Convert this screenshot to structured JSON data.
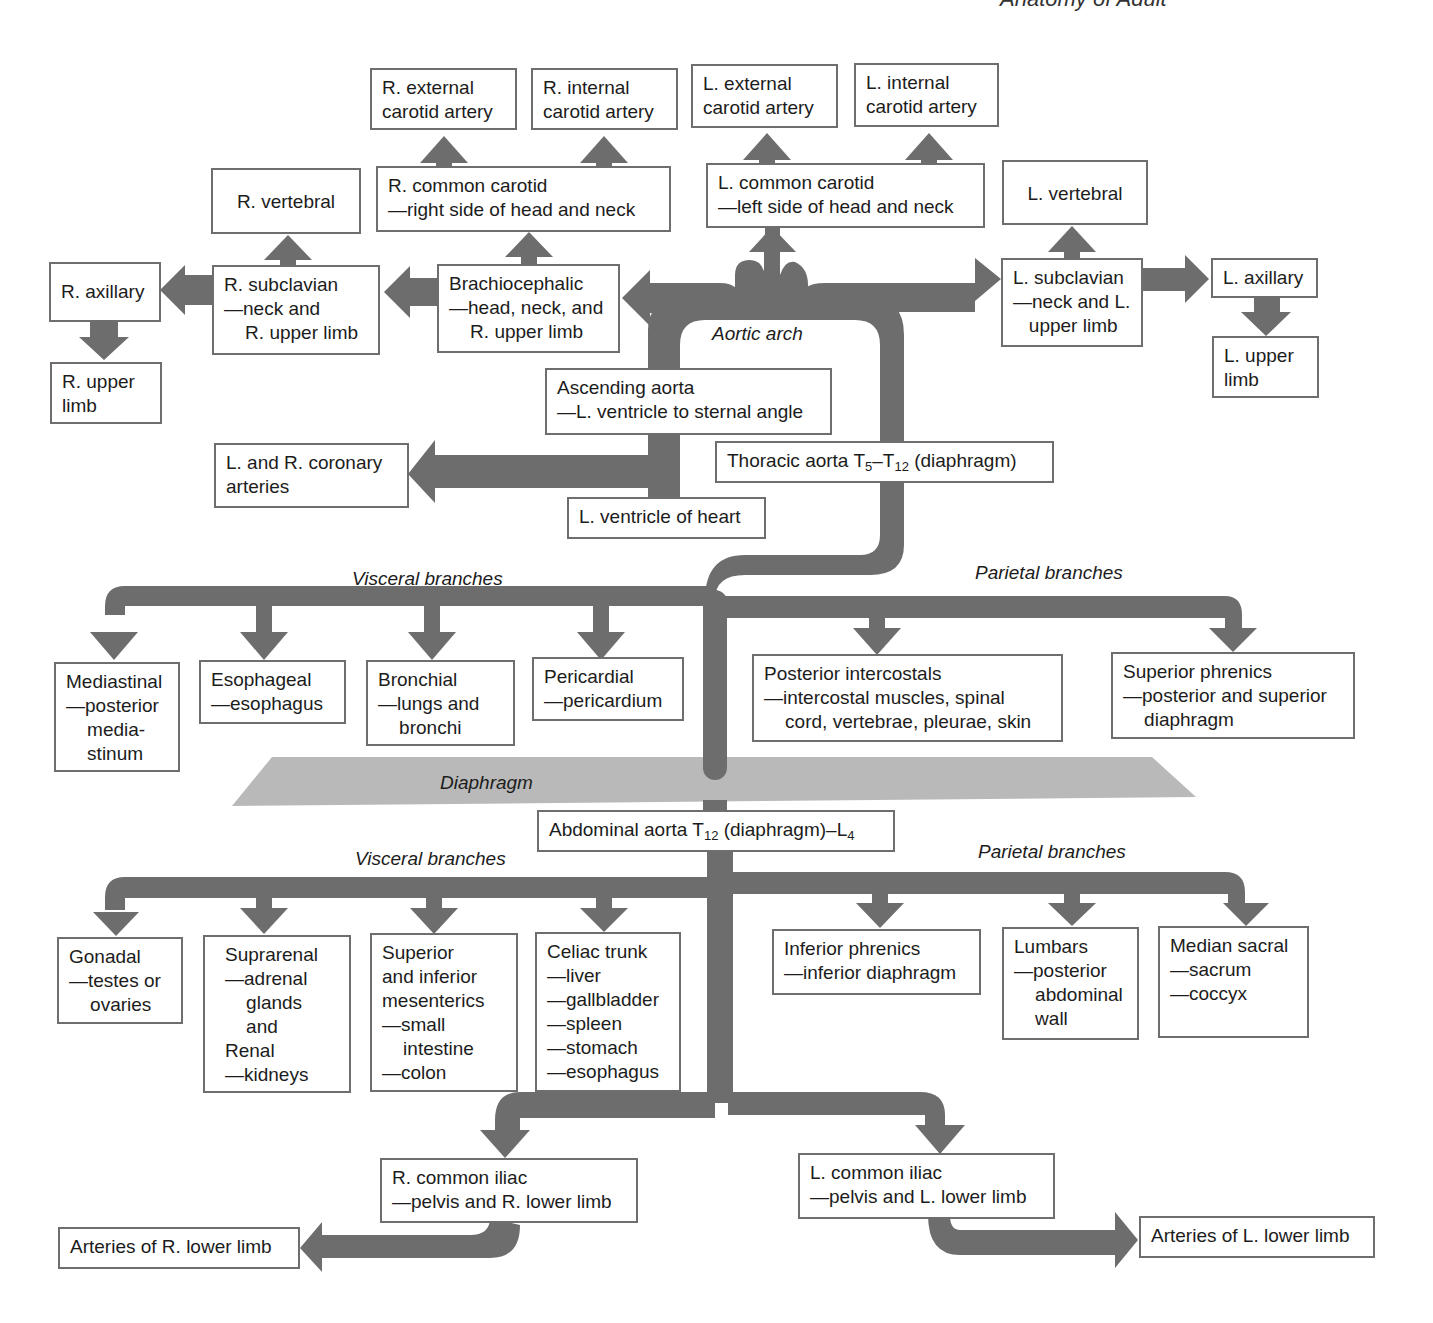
{
  "running_header": "Anatomy of Adult",
  "colors": {
    "pipe": "#6d6d6d",
    "diaphragm": "#b9b9b9",
    "box_border": "#6e6e6e"
  },
  "labels": {
    "aortic_arch": "Aortic arch",
    "diaphragm": "Diaphragm",
    "thoracic_visceral": "Visceral branches",
    "thoracic_parietal": "Parietal branches",
    "abdominal_visceral": "Visceral branches",
    "abdominal_parietal": "Parietal branches"
  },
  "head_neck": {
    "r_external_carotid": "R. external\ncarotid artery",
    "r_internal_carotid": "R. internal\ncarotid artery",
    "l_external_carotid": "L. external\ncarotid artery",
    "l_internal_carotid": "L. internal\ncarotid artery",
    "r_common_carotid": "R. common carotid\n—right side of head and neck",
    "l_common_carotid": "L. common carotid\n—left side of head and neck",
    "r_vertebral": "R. vertebral",
    "l_vertebral": "L. vertebral"
  },
  "upper_limb": {
    "r_axillary": "R. axillary",
    "r_upper_limb": "R. upper\nlimb",
    "r_subclavian": "R. subclavian\n—neck and\n    R. upper limb",
    "brachiocephalic": "Brachiocephalic\n—head, neck, and\n    R. upper limb",
    "l_subclavian": "L. subclavian\n—neck and L.\n   upper limb",
    "l_axillary": "L. axillary",
    "l_upper_limb": "L. upper\nlimb"
  },
  "heart": {
    "ascending_aorta": "Ascending aorta\n—L. ventricle to sternal angle",
    "coronary": "L. and R. coronary\narteries",
    "l_ventricle": "L. ventricle of heart",
    "thoracic_aorta_prefix": "Thoracic aorta T",
    "thoracic_aorta_sub1": "5",
    "thoracic_aorta_mid": "–T",
    "thoracic_aorta_sub2": "12",
    "thoracic_aorta_suffix": " (diaphragm)"
  },
  "thoracic_visceral": [
    "Mediastinal\n—posterior\n    media-\n    stinum",
    "Esophageal\n—esophagus",
    "Bronchial\n—lungs and\n    bronchi",
    "Pericardial\n—pericardium"
  ],
  "thoracic_parietal": [
    "Posterior intercostals\n—intercostal muscles, spinal\n    cord, vertebrae, pleurae, skin",
    "Superior phrenics\n—posterior and superior\n    diaphragm"
  ],
  "abdominal": {
    "prefix": "Abdominal aorta T",
    "sub1": "12",
    "mid": " (diaphragm)–L",
    "sub2": "4"
  },
  "abdominal_visceral": [
    "Gonadal\n—testes or\n    ovaries",
    "Suprarenal\n—adrenal\n    glands\n    and\nRenal\n—kidneys",
    "Superior\nand inferior\nmesenterics\n—small\n    intestine\n—colon",
    "Celiac trunk\n—liver\n—gallbladder\n—spleen\n—stomach\n—esophagus"
  ],
  "abdominal_parietal": [
    "Inferior phrenics\n—inferior diaphragm",
    "Lumbars\n—posterior\n    abdominal\n    wall",
    "Median sacral\n—sacrum\n—coccyx"
  ],
  "iliac": {
    "r_common_iliac": "R. common iliac\n—pelvis and R. lower limb",
    "l_common_iliac": "L. common iliac\n—pelvis and L. lower limb",
    "r_lower_limb": "Arteries of R. lower limb",
    "l_lower_limb": "Arteries of L. lower limb"
  }
}
